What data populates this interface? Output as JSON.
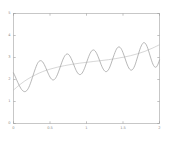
{
  "chart_data": {
    "type": "line",
    "title": "",
    "subtitle": "",
    "xlabel": "",
    "ylabel": "",
    "xlim": [
      0,
      2
    ],
    "ylim": [
      0,
      5
    ],
    "grid": false,
    "legend": null,
    "xticks": [
      0,
      0.5,
      1,
      1.5,
      2
    ],
    "xticklabels": [
      "0",
      "0.5",
      "1",
      "1.5",
      "2"
    ],
    "yticks": [
      0,
      1,
      2,
      3,
      4,
      5
    ],
    "yticklabels": [
      "0",
      "1",
      "2",
      "3",
      "4",
      "5"
    ],
    "series": [
      {
        "name": "oscillating-signal",
        "color": "#9a9a9a",
        "linewidth": 0.7,
        "description": "Growing-amplitude oscillation about a rising baseline, about 8 cycles across the domain",
        "x": [
          0.0,
          0.02,
          0.04,
          0.06,
          0.08,
          0.1,
          0.12,
          0.14,
          0.16,
          0.18,
          0.2,
          0.22,
          0.24,
          0.26,
          0.28,
          0.3,
          0.32,
          0.34,
          0.36,
          0.38,
          0.4,
          0.42,
          0.44,
          0.46,
          0.48,
          0.5,
          0.52,
          0.54,
          0.56,
          0.58,
          0.6,
          0.62,
          0.64,
          0.66,
          0.68,
          0.7,
          0.72,
          0.74,
          0.76,
          0.78,
          0.8,
          0.82,
          0.84,
          0.86,
          0.88,
          0.9,
          0.92,
          0.94,
          0.96,
          0.98,
          1.0,
          1.02,
          1.04,
          1.06,
          1.08,
          1.1,
          1.12,
          1.14,
          1.16,
          1.18,
          1.2,
          1.22,
          1.24,
          1.26,
          1.28,
          1.3,
          1.32,
          1.34,
          1.36,
          1.38,
          1.4,
          1.42,
          1.44,
          1.46,
          1.48,
          1.5,
          1.52,
          1.54,
          1.56,
          1.58,
          1.6,
          1.62,
          1.64,
          1.66,
          1.68,
          1.7,
          1.72,
          1.74,
          1.76,
          1.78,
          1.8,
          1.82,
          1.84,
          1.86,
          1.88,
          1.9,
          1.92,
          1.94,
          1.96,
          1.98,
          2.0
        ],
        "y": [
          2.3,
          2.16,
          2.01,
          1.86,
          1.72,
          1.6,
          1.51,
          1.46,
          1.45,
          1.49,
          1.58,
          1.72,
          1.9,
          2.1,
          2.31,
          2.5,
          2.67,
          2.79,
          2.85,
          2.85,
          2.8,
          2.69,
          2.55,
          2.39,
          2.24,
          2.11,
          2.02,
          1.98,
          2.0,
          2.08,
          2.21,
          2.38,
          2.57,
          2.76,
          2.93,
          3.06,
          3.14,
          3.16,
          3.12,
          3.02,
          2.88,
          2.72,
          2.55,
          2.4,
          2.29,
          2.23,
          2.23,
          2.29,
          2.41,
          2.57,
          2.76,
          2.95,
          3.12,
          3.25,
          3.33,
          3.34,
          3.29,
          3.18,
          3.03,
          2.86,
          2.68,
          2.53,
          2.42,
          2.36,
          2.37,
          2.44,
          2.57,
          2.75,
          2.95,
          3.14,
          3.31,
          3.43,
          3.48,
          3.46,
          3.37,
          3.22,
          3.04,
          2.84,
          2.66,
          2.52,
          2.44,
          2.43,
          2.49,
          2.62,
          2.81,
          3.03,
          3.25,
          3.45,
          3.59,
          3.67,
          3.66,
          3.57,
          3.41,
          3.2,
          2.98,
          2.78,
          2.63,
          2.56,
          2.58,
          2.7,
          2.89
        ]
      },
      {
        "name": "trend-baseline",
        "color": "#bcbcbc",
        "linewidth": 0.6,
        "description": "Smooth monotonically rising baseline curve",
        "x": [
          0.0,
          0.1,
          0.2,
          0.3,
          0.4,
          0.5,
          0.6,
          0.7,
          0.8,
          0.9,
          1.0,
          1.1,
          1.2,
          1.3,
          1.4,
          1.5,
          1.6,
          1.7,
          1.8,
          1.9,
          2.0
        ],
        "y": [
          1.52,
          1.8,
          2.03,
          2.21,
          2.36,
          2.47,
          2.56,
          2.63,
          2.69,
          2.74,
          2.78,
          2.82,
          2.86,
          2.9,
          2.95,
          3.01,
          3.08,
          3.17,
          3.28,
          3.42,
          3.58
        ]
      }
    ]
  },
  "style": {
    "background": "#ffffff",
    "frame_color": "#b0b0b0",
    "tick_color": "#9a9a9a",
    "label_color": "#8d8d8d"
  }
}
